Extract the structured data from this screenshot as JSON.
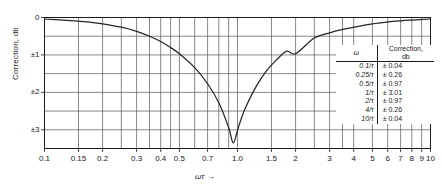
{
  "chart_data": {
    "type": "line",
    "title": "",
    "xlabel": "ωτ →",
    "ylabel": "Correction, db",
    "xscale": "log",
    "xlim": [
      0.1,
      10
    ],
    "ylim": [
      0,
      3.5
    ],
    "y_inverted": true,
    "grid": true,
    "legend": "none",
    "x_ticks": [
      "0.1",
      "0.15",
      "0.2",
      "0.3",
      "0.4",
      "0.5",
      "0.7",
      "1.0",
      "1.5",
      "2",
      "3",
      "4",
      "5",
      "6",
      "7",
      "8",
      "9",
      "10"
    ],
    "x_tick_values": [
      0.1,
      0.15,
      0.2,
      0.3,
      0.4,
      0.5,
      0.7,
      1.0,
      1.5,
      2,
      3,
      4,
      5,
      6,
      7,
      8,
      9,
      10
    ],
    "y_ticks": [
      "0",
      "±1",
      "±2",
      "±3"
    ],
    "y_tick_values": [
      0,
      1,
      2,
      3
    ],
    "y_gridline_values": [
      0,
      0.5,
      1.0,
      1.5,
      2.0,
      2.5,
      3.0,
      3.5
    ],
    "series": [
      {
        "name": "Correction",
        "x": [
          0.1,
          0.125,
          0.15,
          0.175,
          0.2,
          0.25,
          0.3,
          0.35,
          0.4,
          0.45,
          0.5,
          0.6,
          0.7,
          0.8,
          0.9,
          0.95,
          1.0,
          1.05,
          1.1,
          1.25,
          1.4,
          1.6,
          1.8,
          2.0,
          2.5,
          3.0,
          3.5,
          4.0,
          5.0,
          6.0,
          7.0,
          8.0,
          10.0
        ],
        "values": [
          0.04,
          0.07,
          0.1,
          0.13,
          0.17,
          0.26,
          0.37,
          0.5,
          0.64,
          0.8,
          0.97,
          1.34,
          1.77,
          2.28,
          2.94,
          3.35,
          3.01,
          2.68,
          2.41,
          1.84,
          1.45,
          1.12,
          0.9,
          0.97,
          0.55,
          0.41,
          0.32,
          0.26,
          0.17,
          0.12,
          0.09,
          0.07,
          0.04
        ]
      }
    ],
    "curve_vertex": {
      "x": 1.0,
      "y": 3.01
    },
    "annotations": []
  },
  "table": {
    "headers": {
      "omega": "ω",
      "correction_line1": "Correction,",
      "correction_line2": "db"
    },
    "rows": [
      {
        "omega": "0.1/τ",
        "correction": "± 0.04"
      },
      {
        "omega": "0.25/τ",
        "correction": "± 0.26"
      },
      {
        "omega": "0.5/τ",
        "correction": "± 0.97"
      },
      {
        "omega": "1/τ",
        "correction": "± 3.01"
      },
      {
        "omega": "2/τ",
        "correction": "± 0.97"
      },
      {
        "omega": "4/τ",
        "correction": "± 0.26"
      },
      {
        "omega": "10/τ",
        "correction": "± 0.04"
      }
    ]
  },
  "colors": {
    "curve": "#262626",
    "grid": "#555555",
    "axis": "#1a1a1a",
    "background": "#ffffff"
  }
}
